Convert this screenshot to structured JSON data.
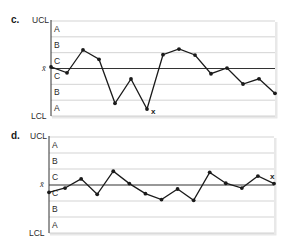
{
  "chart_data": [
    {
      "type": "line",
      "panel_label": "c.",
      "title": "Control chart c",
      "limit_labels": {
        "upper": "UCL",
        "center": "x̄",
        "lower": "LCL"
      },
      "zone_labels_top_to_bottom": [
        "A",
        "B",
        "C",
        "C",
        "B",
        "A"
      ],
      "y_unit": "sigma zones from center line",
      "ylim": [
        -3,
        3
      ],
      "grid": true,
      "x": [
        1,
        2,
        3,
        4,
        5,
        6,
        7,
        8,
        9,
        10,
        11,
        12,
        13,
        14,
        15
      ],
      "values": [
        0.1,
        -0.27,
        1.17,
        0.58,
        -2.2,
        -0.66,
        -2.56,
        0.87,
        1.23,
        0.85,
        -0.33,
        0.03,
        -0.98,
        -0.65,
        -1.57
      ],
      "annotations": [
        {
          "text": "x",
          "point_index": 6,
          "position": "below-right"
        }
      ]
    },
    {
      "type": "line",
      "panel_label": "d.",
      "title": "Control chart d",
      "limit_labels": {
        "upper": "UCL",
        "center": "x̄",
        "lower": "LCL"
      },
      "zone_labels_top_to_bottom": [
        "A",
        "B",
        "C",
        "C",
        "B",
        "A"
      ],
      "y_unit": "sigma zones from center line",
      "ylim": [
        -3,
        3
      ],
      "grid": true,
      "x": [
        1,
        2,
        3,
        4,
        5,
        6,
        7,
        8,
        9,
        10,
        11,
        12,
        13,
        14,
        15
      ],
      "values": [
        -0.46,
        -0.19,
        0.38,
        -0.58,
        0.86,
        0.09,
        -0.54,
        -0.91,
        -0.25,
        -0.96,
        0.79,
        0.11,
        -0.19,
        0.56,
        0.09
      ],
      "annotations": [
        {
          "text": "x",
          "point_index": 14,
          "position": "above-left"
        }
      ]
    }
  ],
  "layout": {
    "panels": [
      {
        "top": 0,
        "plot_top": 21,
        "plot_bottom": 116,
        "plot_left": 51,
        "plot_right": 275
      },
      {
        "top": 124,
        "plot_top": 13,
        "plot_bottom": 109,
        "plot_left": 49,
        "plot_right": 274
      }
    ],
    "colors": {
      "gridline": "#c8c8c8",
      "center_line": "#333333",
      "axis": "#333333",
      "series": "#1a1a1a",
      "shadow": "#d9d9d9"
    }
  }
}
